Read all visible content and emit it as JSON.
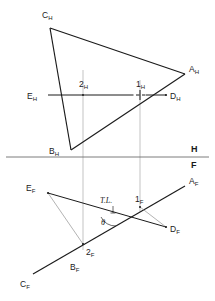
{
  "figure": {
    "type": "descriptive-geometry-orthographic-projection",
    "colors": {
      "object_line": "#1a1a1a",
      "projection_line": "#9a9a9a",
      "reference_line": "#6e6e6e",
      "background": "#ffffff",
      "text": "#1a1a1a"
    }
  },
  "reference_line": {
    "upper_label": "H",
    "lower_label": "F",
    "y": 157
  },
  "horizontal_view": {
    "name": "top-view",
    "points": [
      {
        "id": "A_H",
        "label": "A",
        "subscript": "H",
        "x": 185,
        "y": 74,
        "label_x": 189,
        "label_y": 72
      },
      {
        "id": "B_H",
        "label": "B",
        "subscript": "H",
        "x": 71,
        "y": 150,
        "label_x": 49,
        "label_y": 153
      },
      {
        "id": "C_H",
        "label": "C",
        "subscript": "H",
        "x": 50,
        "y": 28,
        "label_x": 42,
        "label_y": 17
      },
      {
        "id": "D_H",
        "label": "D",
        "subscript": "H",
        "x": 166,
        "y": 95,
        "label_x": 170,
        "label_y": 99
      },
      {
        "id": "E_H",
        "label": "E",
        "subscript": "H",
        "x": 48,
        "y": 95,
        "label_x": 27,
        "label_y": 99
      },
      {
        "id": "1_H",
        "label": "1",
        "subscript": "H",
        "x": 140,
        "y": 95,
        "label_x": 136,
        "label_y": 86
      },
      {
        "id": "2_H",
        "label": "2",
        "subscript": "H",
        "x": 83,
        "y": 95,
        "label_x": 79,
        "label_y": 86
      }
    ],
    "edges": [
      {
        "from": "C_H",
        "to": "A_H",
        "style": "solid"
      },
      {
        "from": "C_H",
        "to": "B_H",
        "style": "solid"
      },
      {
        "from": "B_H",
        "to": "A_H",
        "style": "solid"
      }
    ],
    "cutting_line": {
      "from": "E_H",
      "to": "D_H",
      "style": "solid-with-dashed-segment"
    }
  },
  "frontal_view": {
    "name": "front-view",
    "points": [
      {
        "id": "A_F",
        "label": "A",
        "subscript": "F",
        "x": 185,
        "y": 186,
        "label_x": 189,
        "label_y": 184
      },
      {
        "id": "B_F",
        "label": "B",
        "subscript": "F",
        "x": 83,
        "y": 244,
        "label_x": 72,
        "label_y": 268
      },
      {
        "id": "C_F",
        "label": "C",
        "subscript": "F",
        "x": 33,
        "y": 274,
        "label_x": 22,
        "label_y": 285
      },
      {
        "id": "D_F",
        "label": "D",
        "subscript": "F",
        "x": 166,
        "y": 227,
        "label_x": 170,
        "label_y": 231
      },
      {
        "id": "E_F",
        "label": "E",
        "subscript": "F",
        "x": 48,
        "y": 193,
        "label_x": 27,
        "label_y": 191
      },
      {
        "id": "1_F",
        "label": "1",
        "subscript": "F",
        "x": 140,
        "y": 207,
        "label_x": 136,
        "label_y": 201
      },
      {
        "id": "2_F",
        "label": "2",
        "subscript": "F",
        "x": 83,
        "y": 244,
        "label_x": 87,
        "label_y": 254
      }
    ],
    "edges": [
      {
        "from": "C_F",
        "to": "A_F",
        "style": "solid"
      },
      {
        "from": "E_F",
        "to": "D_F",
        "style": "solid"
      },
      {
        "from": "E_F",
        "to": "2_F",
        "style": "thin"
      },
      {
        "from": "1_F",
        "to": "D_F",
        "style": "thin"
      }
    ],
    "true_length": {
      "label": "T.L.",
      "label_x": 106,
      "label_y": 202,
      "leader_x": 113,
      "leader_y1": 205,
      "leader_y2": 213
    },
    "angle": {
      "label": "θ",
      "label_x": 104,
      "label_y": 222,
      "vertex_x": 112,
      "vertex_y": 215
    }
  },
  "projection_lines": [
    {
      "name": "projector-point-2",
      "x": 83,
      "y1": 70,
      "y2": 250
    },
    {
      "name": "projector-point-1",
      "x": 140,
      "y1": 80,
      "y2": 212
    }
  ]
}
